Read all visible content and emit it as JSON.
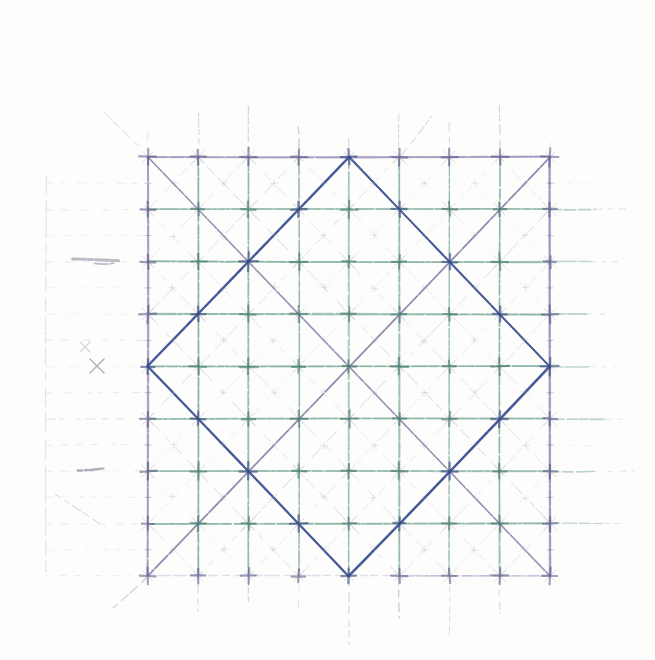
{
  "figure": {
    "type": "hand-drawn-geometric-sketch",
    "canvas": {
      "width": 655,
      "height": 660,
      "paper_color": "#fdfdfc"
    },
    "square": {
      "left": 148,
      "top": 157,
      "right": 550,
      "bottom": 576,
      "cols": 8,
      "rows": 8
    },
    "diamond": {
      "vertices_grid": [
        [
          4,
          0
        ],
        [
          8,
          4
        ],
        [
          4,
          8
        ],
        [
          0,
          4
        ]
      ]
    },
    "colors": {
      "teal_row": "#55917f",
      "teal_col": "#4f8679",
      "teal_node": "#2e6a5c",
      "purple_edge": "#8f86b2",
      "purple_node": "#4f4b7e",
      "main_diagonal": "#7f78a3",
      "faint_diag_a": "#a8a2c6",
      "faint_diag_b": "#9fb0b6",
      "diamond": "#3a4f91",
      "diamond_node": "#2d3f7c",
      "pencil": "#b4aec8",
      "graphite": "#6f6b86",
      "center_mark": "#98a2a8",
      "cross_arm": "#8f89b0",
      "bottom_edge": "#a49ec0"
    },
    "margin": {
      "pencil_vertical_x": 46,
      "pencil_vertical_y1": 176,
      "pencil_vertical_y2": 572,
      "left_dash_x1": 46,
      "right_extension_max_x": 645,
      "top_extension_min": 12,
      "top_extension_max": 52,
      "bottom_extension_min": 18,
      "bottom_extension_max": 64
    },
    "marks": [
      {
        "type": "scribble",
        "x1": 72,
        "y1": 259,
        "x2": 118,
        "y2": 260,
        "width": 3,
        "opacity": 0.55
      },
      {
        "type": "scribble",
        "x1": 94,
        "y1": 263,
        "x2": 113,
        "y2": 264,
        "width": 2,
        "opacity": 0.45
      },
      {
        "type": "scribble",
        "x1": 78,
        "y1": 470,
        "x2": 104,
        "y2": 469,
        "width": 2.4,
        "opacity": 0.5
      },
      {
        "type": "cross",
        "x": 97,
        "y": 366,
        "size": 7,
        "opacity": 0.55
      },
      {
        "type": "cross",
        "x": 85,
        "y": 347,
        "size": 5,
        "opacity": 0.28
      },
      {
        "type": "diag",
        "x1": 56,
        "y1": 494,
        "x2": 104,
        "y2": 527,
        "opacity": 0.26
      },
      {
        "type": "diag",
        "x1": 104,
        "y1": 112,
        "x2": 138,
        "y2": 146,
        "opacity": 0.18
      },
      {
        "type": "diag",
        "x1": 399,
        "y1": 157,
        "x2": 432,
        "y2": 116,
        "opacity": 0.3
      },
      {
        "type": "diag",
        "x1": 148,
        "y1": 576,
        "x2": 113,
        "y2": 608,
        "opacity": 0.45
      }
    ],
    "seed": 7
  }
}
